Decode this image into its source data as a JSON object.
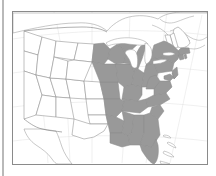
{
  "figure": {
    "kind": "choropleth-map",
    "title": "",
    "caption": "",
    "region": "United States",
    "projection": "conic",
    "frame_visible": true,
    "frame_color": "#8a8a8a",
    "background_color": "#ffffff"
  },
  "legend": {
    "visible": false,
    "entries": [
      {
        "label": "Highlighted states",
        "color": "#999999"
      },
      {
        "label": "Other states",
        "color": "#ffffff"
      }
    ]
  },
  "colors": {
    "highlight_fill": "#999999",
    "plain_fill": "#ffffff",
    "state_border": "#8d8d8d",
    "country_border": "#7a7a7a",
    "coastline": "#9a9a9a",
    "frame": "#8a8a8a",
    "left_rule": "#b9b9b9",
    "graticule": "#d8d8d8"
  },
  "map_data": {
    "type": "choropleth",
    "highlighted_regions": [
      "Minnesota",
      "Iowa",
      "Missouri",
      "Arkansas",
      "Louisiana",
      "Wisconsin",
      "Illinois",
      "Michigan",
      "Indiana",
      "Ohio",
      "Kentucky",
      "Tennessee",
      "Mississippi",
      "Alabama",
      "Georgia",
      "Florida",
      "South Carolina",
      "North Carolina",
      "Virginia",
      "West Virginia",
      "Maryland",
      "Delaware",
      "Pennsylvania",
      "New Jersey",
      "New York",
      "Connecticut",
      "Rhode Island",
      "Massachusetts"
    ],
    "unhighlighted_regions": [
      "Washington",
      "Oregon",
      "California",
      "Idaho",
      "Nevada",
      "Utah",
      "Arizona",
      "Montana",
      "Wyoming",
      "Colorado",
      "New Mexico",
      "North Dakota",
      "South Dakota",
      "Nebraska",
      "Kansas",
      "Oklahoma",
      "Texas",
      "Maine",
      "New Hampshire",
      "Vermont"
    ],
    "neighbors_shown": [
      "Canada",
      "Mexico",
      "Cuba",
      "Bahamas"
    ],
    "water_bodies": [
      "Lake Superior",
      "Lake Michigan",
      "Lake Huron",
      "Lake Erie",
      "Lake Ontario",
      "Atlantic Ocean",
      "Gulf of Mexico"
    ],
    "labels": []
  }
}
